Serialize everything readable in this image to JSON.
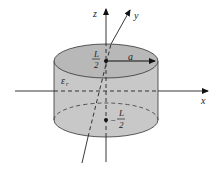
{
  "diagram": {
    "type": "cylinder-coordinate-system",
    "axes": {
      "x": {
        "label": "x"
      },
      "y": {
        "label": "y"
      },
      "z": {
        "label": "z"
      }
    },
    "cylinder": {
      "material_label": "ε",
      "material_subscript": "r",
      "radius_label": "a",
      "top_label_num": "L",
      "top_label_den": "2",
      "bottom_label_sign": "−",
      "bottom_label_num": "L",
      "bottom_label_den": "2",
      "fill_color": "#c8c8c8",
      "stroke_color": "#333333"
    }
  }
}
